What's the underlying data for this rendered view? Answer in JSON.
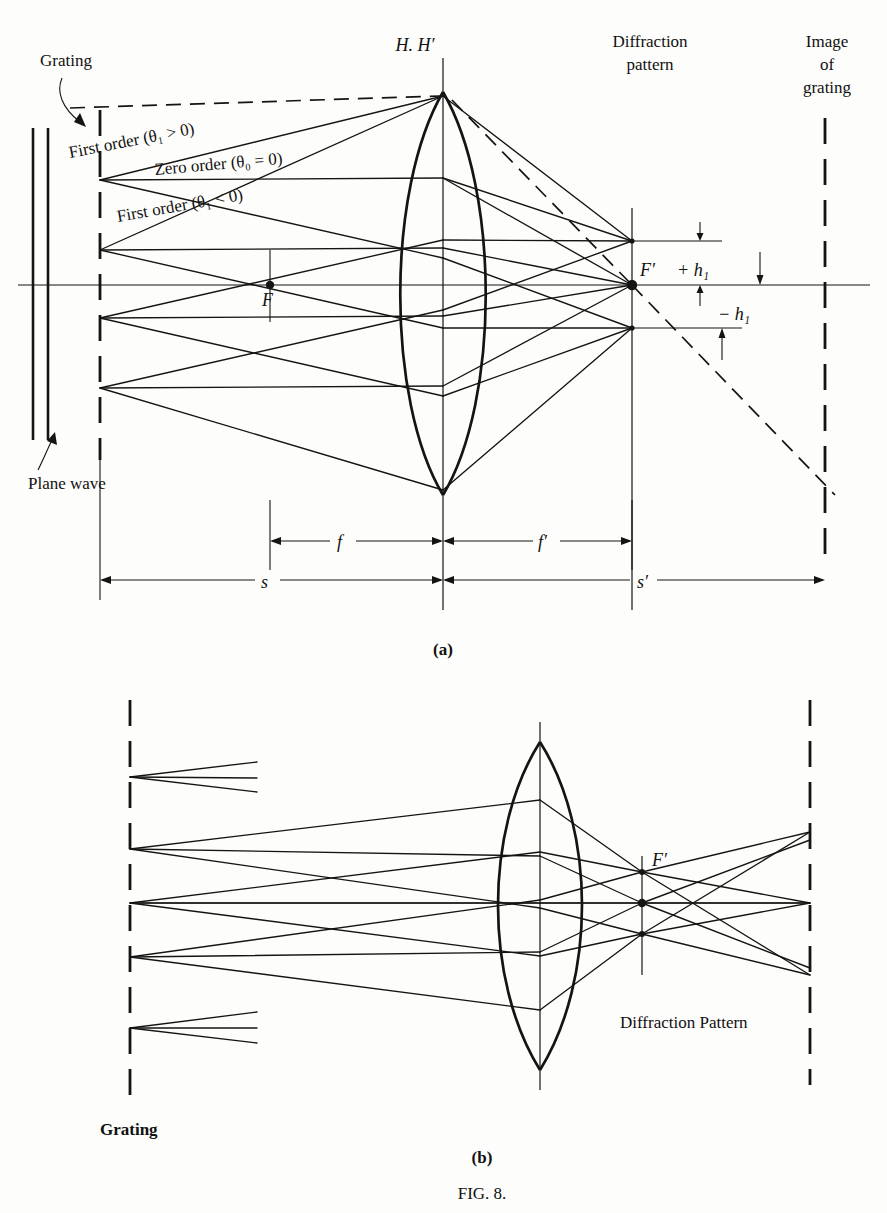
{
  "figure": {
    "caption": "FIG. 8.",
    "panel_a_label": "(a)",
    "panel_b_label": "(b)"
  },
  "panel_a": {
    "labels": {
      "grating": "Grating",
      "plane_wave": "Plane wave",
      "principal_planes": "H. H′",
      "diffraction_pattern_line1": "Diffraction",
      "diffraction_pattern_line2": "pattern",
      "image_of_grating_line1": "Image",
      "image_of_grating_line2": "of",
      "image_of_grating_line3": "grating",
      "first_order_pos": "First order (θ₁ > 0)",
      "zero_order": "Zero order (θ₀ = 0)",
      "first_order_neg": "First order (θ₁ < 0)",
      "focal_point_object": "F",
      "focal_point_image": "F′",
      "plus_h1": "+ h₁",
      "minus_h1": "− h₁"
    },
    "dimensions": {
      "f": "f",
      "f_prime": "f′",
      "s": "s",
      "s_prime": "s′"
    },
    "geometry": {
      "optical_axis_y": 285,
      "grating_x": 100,
      "lens_axis_x": 443,
      "diffraction_plane_x": 632,
      "image_plane_x": 825,
      "focal_point_object_x": 270,
      "source_points_y": [
        180,
        250,
        318,
        388
      ],
      "convergence_y": [
        241,
        285,
        328
      ]
    }
  },
  "panel_b": {
    "labels": {
      "grating": "Grating",
      "focal_point_image": "F′",
      "diffraction_pattern": "Diffraction  Pattern"
    },
    "geometry": {
      "optical_axis_y": 903,
      "grating_x": 130,
      "lens_axis_x": 540,
      "focal_plane_x": 642,
      "image_plane_x": 810,
      "source_points_y": [
        777,
        849,
        903,
        957,
        1028
      ],
      "convergence_y": [
        872,
        903,
        934
      ]
    }
  }
}
